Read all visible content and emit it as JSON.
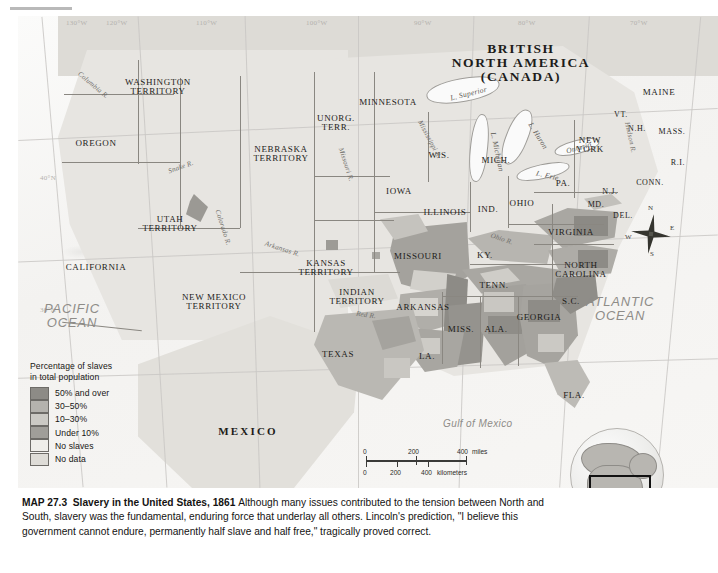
{
  "map": {
    "title_label": "MAP 27.3",
    "title_name": "Slavery in the United States, 1861",
    "caption_body": "Although many issues contributed to the tension between North and South, slavery was the fundamental, enduring force that underlay all others. Lincoln's prediction, \"I believe this government cannot endure, permanently half slave and half free,\" tragically proved correct."
  },
  "legend": {
    "title_line1": "Percentage of slaves",
    "title_line2": "in total population",
    "items": [
      {
        "label": "50% and over",
        "color": "#8d8b86"
      },
      {
        "label": "30–50%",
        "color": "#b4b2ad"
      },
      {
        "label": "10–30%",
        "color": "#cbc9c4"
      },
      {
        "label": "Under 10%",
        "color": "#a09e99"
      },
      {
        "label": "No slaves",
        "color": "#efeeea"
      },
      {
        "label": "No data",
        "color": "#dedcd7"
      }
    ]
  },
  "scale": {
    "miles_ticks": [
      "0",
      "200",
      "400"
    ],
    "miles_unit": "miles",
    "km_ticks": [
      "0",
      "200",
      "400"
    ],
    "km_unit": "kilometers"
  },
  "compass": {
    "n": "N",
    "e": "E",
    "s": "S",
    "w": "W"
  },
  "graticule": {
    "longitude": [
      "130°W",
      "120°W",
      "110°W",
      "100°W",
      "90°W",
      "80°W",
      "70°W"
    ],
    "latitude": [
      "40°N",
      "30°N"
    ]
  },
  "regions": [
    {
      "name": "BRITISH NORTH AMERICA (CANADA)",
      "lines": [
        "BRITISH",
        "NORTH AMERICA",
        "(CANADA)"
      ],
      "x": 503,
      "y": 26,
      "size": "xl"
    },
    {
      "name": "WASHINGTON TERRITORY",
      "lines": [
        "WASHINGTON",
        "TERRITORY"
      ],
      "x": 140,
      "y": 62,
      "size": "md"
    },
    {
      "name": "OREGON",
      "lines": [
        "OREGON"
      ],
      "x": 78,
      "y": 123,
      "size": "md"
    },
    {
      "name": "CALIFORNIA",
      "lines": [
        "CALIFORNIA"
      ],
      "x": 78,
      "y": 247,
      "size": "md"
    },
    {
      "name": "UTAH TERRITORY",
      "lines": [
        "UTAH",
        "TERRITORY"
      ],
      "x": 152,
      "y": 199,
      "size": "md"
    },
    {
      "name": "NEW MEXICO TERRITORY",
      "lines": [
        "NEW MEXICO",
        "TERRITORY"
      ],
      "x": 196,
      "y": 277,
      "size": "md"
    },
    {
      "name": "NEBRASKA TERRITORY",
      "lines": [
        "NEBRASKA",
        "TERRITORY"
      ],
      "x": 263,
      "y": 129,
      "size": "md"
    },
    {
      "name": "UNORG. TERR.",
      "lines": [
        "UNORG.",
        "TERR."
      ],
      "x": 318,
      "y": 98,
      "size": "md"
    },
    {
      "name": "MINNESOTA",
      "lines": [
        "MINNESOTA"
      ],
      "x": 370,
      "y": 82,
      "size": "md"
    },
    {
      "name": "WIS.",
      "lines": [
        "WIS."
      ],
      "x": 421,
      "y": 135,
      "size": "md"
    },
    {
      "name": "IOWA",
      "lines": [
        "IOWA"
      ],
      "x": 381,
      "y": 171,
      "size": "md"
    },
    {
      "name": "ILLINOIS",
      "lines": [
        "ILLINOIS"
      ],
      "x": 427,
      "y": 192,
      "size": "md"
    },
    {
      "name": "IND.",
      "lines": [
        "IND."
      ],
      "x": 470,
      "y": 189,
      "size": "md"
    },
    {
      "name": "MICH.",
      "lines": [
        "MICH."
      ],
      "x": 478,
      "y": 140,
      "size": "md"
    },
    {
      "name": "OHIO",
      "lines": [
        "OHIO"
      ],
      "x": 504,
      "y": 183,
      "size": "md"
    },
    {
      "name": "KANSAS TERRITORY",
      "lines": [
        "KANSAS",
        "TERRITORY"
      ],
      "x": 308,
      "y": 243,
      "size": "md"
    },
    {
      "name": "MISSOURI",
      "lines": [
        "MISSOURI"
      ],
      "x": 400,
      "y": 236,
      "size": "md"
    },
    {
      "name": "INDIAN TERRITORY",
      "lines": [
        "INDIAN",
        "TERRITORY"
      ],
      "x": 339,
      "y": 272,
      "size": "md"
    },
    {
      "name": "TEXAS",
      "lines": [
        "TEXAS"
      ],
      "x": 320,
      "y": 334,
      "size": "md"
    },
    {
      "name": "ARKANSAS",
      "lines": [
        "ARKANSAS"
      ],
      "x": 405,
      "y": 287,
      "size": "md"
    },
    {
      "name": "LA.",
      "lines": [
        "LA."
      ],
      "x": 409,
      "y": 336,
      "size": "md"
    },
    {
      "name": "MISS.",
      "lines": [
        "MISS."
      ],
      "x": 443,
      "y": 309,
      "size": "md"
    },
    {
      "name": "ALA.",
      "lines": [
        "ALA."
      ],
      "x": 478,
      "y": 309,
      "size": "md"
    },
    {
      "name": "GEORGIA",
      "lines": [
        "GEORGIA"
      ],
      "x": 521,
      "y": 297,
      "size": "md"
    },
    {
      "name": "FLA.",
      "lines": [
        "FLA."
      ],
      "x": 556,
      "y": 375,
      "size": "md"
    },
    {
      "name": "TENN.",
      "lines": [
        "TENN."
      ],
      "x": 476,
      "y": 265,
      "size": "md"
    },
    {
      "name": "KY.",
      "lines": [
        "KY."
      ],
      "x": 467,
      "y": 235,
      "size": "md"
    },
    {
      "name": "S.C.",
      "lines": [
        "S.C."
      ],
      "x": 553,
      "y": 281,
      "size": "md"
    },
    {
      "name": "NORTH CAROLINA",
      "lines": [
        "NORTH",
        "CAROLINA"
      ],
      "x": 563,
      "y": 245,
      "size": "md"
    },
    {
      "name": "VIRGINIA",
      "lines": [
        "VIRGINIA"
      ],
      "x": 553,
      "y": 212,
      "size": "md"
    },
    {
      "name": "MD.",
      "lines": [
        "MD."
      ],
      "x": 578,
      "y": 185,
      "size": "sm"
    },
    {
      "name": "DEL.",
      "lines": [
        "DEL."
      ],
      "x": 605,
      "y": 196,
      "size": "sm"
    },
    {
      "name": "PA.",
      "lines": [
        "PA."
      ],
      "x": 545,
      "y": 163,
      "size": "md"
    },
    {
      "name": "N.J.",
      "lines": [
        "N.J."
      ],
      "x": 592,
      "y": 172,
      "size": "sm"
    },
    {
      "name": "NEW YORK",
      "lines": [
        "NEW",
        "YORK"
      ],
      "x": 572,
      "y": 120,
      "size": "md"
    },
    {
      "name": "VT.",
      "lines": [
        "VT."
      ],
      "x": 603,
      "y": 95,
      "size": "sm"
    },
    {
      "name": "N.H.",
      "lines": [
        "N.H."
      ],
      "x": 619,
      "y": 109,
      "size": "sm"
    },
    {
      "name": "MASS.",
      "lines": [
        "MASS."
      ],
      "x": 654,
      "y": 112,
      "size": "sm"
    },
    {
      "name": "R.I.",
      "lines": [
        "R.I."
      ],
      "x": 660,
      "y": 143,
      "size": "sm"
    },
    {
      "name": "CONN.",
      "lines": [
        "CONN."
      ],
      "x": 632,
      "y": 163,
      "size": "sm"
    },
    {
      "name": "MAINE",
      "lines": [
        "MAINE"
      ],
      "x": 641,
      "y": 72,
      "size": "md"
    },
    {
      "name": "MEXICO",
      "lines": [
        "MEXICO"
      ],
      "x": 230,
      "y": 410,
      "size": "mex"
    }
  ],
  "water_labels": [
    {
      "name": "PACIFIC OCEAN",
      "lines": [
        "PACIFIC",
        "OCEAN"
      ],
      "x": 26,
      "y": 286
    },
    {
      "name": "ATLANTIC OCEAN",
      "lines": [
        "ATLANTIC",
        "OCEAN"
      ],
      "x": 568,
      "y": 279
    },
    {
      "name": "Gulf of Mexico",
      "text": "Gulf of Mexico",
      "x": 425,
      "y": 403
    }
  ],
  "rivers": [
    {
      "name": "Columbia R.",
      "text": "Columbia R.",
      "x": 56,
      "y": 66,
      "rot": 40
    },
    {
      "name": "Snake R.",
      "text": "Snake R.",
      "x": 150,
      "y": 148,
      "rot": -20
    },
    {
      "name": "Colorado R.",
      "text": "Colorado R.",
      "x": 186,
      "y": 208,
      "rot": 72
    },
    {
      "name": "Arkansas R.",
      "text": "Arkansas R.",
      "x": 246,
      "y": 230,
      "rot": 18
    },
    {
      "name": "Missouri R.",
      "text": "Missouri R.",
      "x": 310,
      "y": 145,
      "rot": 72
    },
    {
      "name": "Mississippi R.",
      "text": "Mississippi R.",
      "x": 390,
      "y": 120,
      "rot": 62
    },
    {
      "name": "Ohio R.",
      "text": "Ohio R.",
      "x": 472,
      "y": 220,
      "rot": 18
    },
    {
      "name": "Red R.",
      "text": "Red R.",
      "x": 338,
      "y": 296,
      "rot": 8
    },
    {
      "name": "Hudson R.",
      "text": "Hudson R.",
      "x": 596,
      "y": 118,
      "rot": 78
    }
  ],
  "lakes": [
    {
      "name": "L. Superior",
      "text": "L. Superior",
      "x": 432,
      "y": 74,
      "rot": -14
    },
    {
      "name": "L. Michigan",
      "text": "L. Michigan",
      "x": 459,
      "y": 132,
      "rot": 78
    },
    {
      "name": "L. Huron",
      "text": "L. Huron",
      "x": 505,
      "y": 116,
      "rot": 58
    },
    {
      "name": "L. Erie",
      "text": "L. Erie",
      "x": 518,
      "y": 156,
      "rot": 14
    },
    {
      "name": "L. Ontario",
      "text": "Ontario",
      "x": 548,
      "y": 128,
      "rot": -16
    }
  ]
}
